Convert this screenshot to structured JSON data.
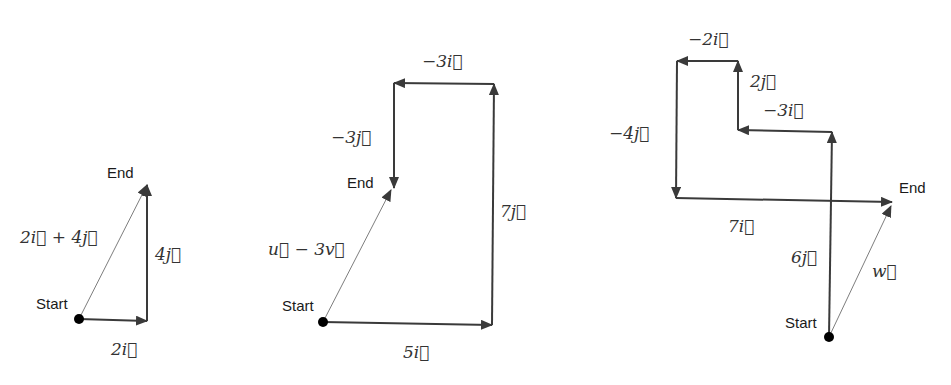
{
  "colors": {
    "arrow": "#3a3a3a",
    "resultant": "#6e6e6e",
    "text": "#1a1a1a",
    "math": "#333333",
    "dot": "#000000"
  },
  "diagrams": [
    {
      "start": {
        "x": 79,
        "y": 319,
        "label": "Start",
        "lx": 36,
        "ly": 309
      },
      "end_label": {
        "text": "End",
        "x": 107,
        "y": 178
      },
      "components": [
        {
          "from": [
            79,
            319
          ],
          "to": [
            147,
            321
          ],
          "label": "2i⃗",
          "lx": 111,
          "ly": 355
        },
        {
          "from": [
            147,
            321
          ],
          "to": [
            147,
            185
          ],
          "label": "4j⃗",
          "lx": 155,
          "ly": 260
        }
      ],
      "resultant": {
        "from": [
          79,
          319
        ],
        "to": [
          147,
          185
        ],
        "label": "2i⃗ + 4j⃗",
        "lx": 20,
        "ly": 243
      }
    },
    {
      "start": {
        "x": 323,
        "y": 322,
        "label": "Start",
        "lx": 282,
        "ly": 311
      },
      "end_label": {
        "text": "End",
        "x": 347,
        "y": 188
      },
      "components": [
        {
          "from": [
            323,
            322
          ],
          "to": [
            492,
            325
          ],
          "label": "5i⃗",
          "lx": 403,
          "ly": 358
        },
        {
          "from": [
            492,
            325
          ],
          "to": [
            494,
            84
          ],
          "label": "7j⃗",
          "lx": 500,
          "ly": 217
        },
        {
          "from": [
            494,
            84
          ],
          "to": [
            394,
            83
          ],
          "label": "−3i⃗",
          "lx": 422,
          "ly": 67
        },
        {
          "from": [
            394,
            83
          ],
          "to": [
            394,
            188
          ],
          "label": "−3j⃗",
          "lx": 331,
          "ly": 143
        }
      ],
      "resultant": {
        "from": [
          323,
          322
        ],
        "to": [
          391,
          190
        ],
        "label": "u⃗  − 3v⃗",
        "lx": 268,
        "ly": 255
      }
    },
    {
      "start": {
        "x": 829,
        "y": 337,
        "label": "Start",
        "lx": 785,
        "ly": 328
      },
      "end_label": {
        "text": "End",
        "x": 899,
        "y": 193
      },
      "components": [
        {
          "from": [
            829,
            337
          ],
          "to": [
            832,
            132
          ],
          "label": "6j⃗",
          "lx": 791,
          "ly": 263
        },
        {
          "from": [
            832,
            132
          ],
          "to": [
            738,
            130
          ],
          "label": "−3i⃗",
          "lx": 763,
          "ly": 116
        },
        {
          "from": [
            738,
            130
          ],
          "to": [
            738,
            61
          ],
          "label": "2j⃗",
          "lx": 750,
          "ly": 87
        },
        {
          "from": [
            738,
            61
          ],
          "to": [
            677,
            61
          ],
          "label": "−2i⃗",
          "lx": 688,
          "ly": 45
        },
        {
          "from": [
            677,
            61
          ],
          "to": [
            676,
            198
          ],
          "label": "−4j⃗",
          "lx": 609,
          "ly": 139
        },
        {
          "from": [
            676,
            198
          ],
          "to": [
            892,
            202
          ],
          "label": "7i⃗",
          "lx": 728,
          "ly": 232
        }
      ],
      "resultant": {
        "from": [
          829,
          337
        ],
        "to": [
          891,
          206
        ],
        "label": "w⃗",
        "lx": 872,
        "ly": 277
      }
    }
  ]
}
